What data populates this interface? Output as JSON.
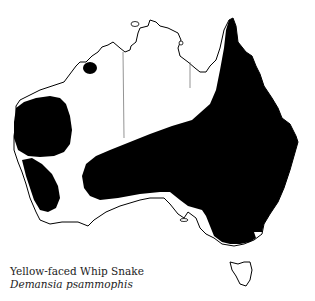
{
  "map": {
    "title": "Distribution map of Australia",
    "region": "Australia",
    "colors": {
      "background": "#ffffff",
      "range_fill": "#000000",
      "coastline": "#000000",
      "state_border": "#555555"
    }
  },
  "caption": {
    "common_name": "Yellow-faced Whip Snake",
    "scientific_name": "Demansia psammophis"
  }
}
